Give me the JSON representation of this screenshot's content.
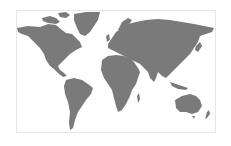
{
  "map": {
    "type": "world-map",
    "style": "silhouette",
    "land_color": "#7a7a7a",
    "background_color": "#ffffff",
    "border_color": "#e6e6e6",
    "regions": [
      "north-america",
      "greenland",
      "south-america",
      "europe",
      "asia",
      "africa",
      "australia"
    ]
  }
}
